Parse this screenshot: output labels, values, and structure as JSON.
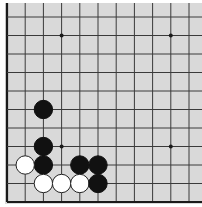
{
  "board": {
    "title": "Go board diagram (corner position)",
    "background_color": "#d9d9d9",
    "line_color": "#3a3a3a",
    "border_color": "#1a1a1a",
    "black_color": "#111111",
    "white_color": "#ffffff",
    "origin_x": 7,
    "origin_y": 17,
    "spacing_x": 18.2,
    "spacing_y": 18.5,
    "cols": 11,
    "rows": 11,
    "stone_radius": 9.2,
    "star_radius": 2,
    "edges": [
      "left",
      "bottom"
    ]
  },
  "star_points": [
    {
      "col": 3,
      "row": 1
    },
    {
      "col": 9,
      "row": 1
    },
    {
      "col": 3,
      "row": 7
    },
    {
      "col": 9,
      "row": 7
    }
  ],
  "stones": [
    {
      "color": "black",
      "col": 2,
      "row": 5
    },
    {
      "color": "black",
      "col": 2,
      "row": 7
    },
    {
      "color": "black",
      "col": 2,
      "row": 8
    },
    {
      "color": "white",
      "col": 1,
      "row": 8
    },
    {
      "color": "black",
      "col": 4,
      "row": 8
    },
    {
      "color": "black",
      "col": 5,
      "row": 8
    },
    {
      "color": "white",
      "col": 2,
      "row": 9
    },
    {
      "color": "white",
      "col": 3,
      "row": 9
    },
    {
      "color": "white",
      "col": 4,
      "row": 9
    },
    {
      "color": "black",
      "col": 5,
      "row": 9
    }
  ]
}
